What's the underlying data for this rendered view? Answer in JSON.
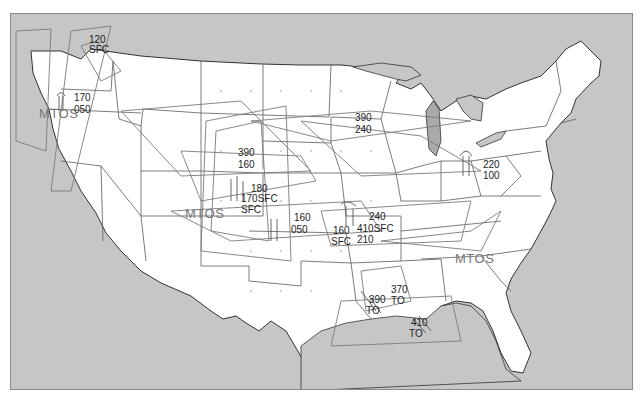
{
  "map": {
    "title": "AIRMET Tango – Turbulence / Strong Surface Winds",
    "colors": {
      "water": "#c6c6c6",
      "land": "#ffffff",
      "state_border": "#5a5a5a",
      "coast": "#333333",
      "airmet_line": "#7a7a7a",
      "label": "#222222",
      "mtos_label": "#7a7a7a",
      "frame": "#8a8a8a"
    },
    "frame": {
      "x": 10,
      "y": 13,
      "width": 623,
      "height": 377
    }
  },
  "labels": {
    "nw_top": "120",
    "nw_bottom": "SFC",
    "nw2_top": "170",
    "nw2_bottom": "050",
    "mtos_west": "MTOS",
    "rockies_top": "390",
    "rockies_bottom": "160",
    "rockies2_top": "180",
    "rockies2_mid": "170SFC",
    "rockies2_bottom": "SFC",
    "mtos_central": "MTOS",
    "plains_top": "160",
    "plains_bottom": "050",
    "kansas_top": "160",
    "kansas_bottom": "SFC",
    "ozark_top": "240",
    "ozark_mid": "410SFC",
    "ozark_bottom": "210",
    "northplains_top": "390",
    "northplains_bottom": "240",
    "ohio_top": "220",
    "ohio_bottom": "100",
    "mtos_east": "MTOS",
    "gulf_top": "370",
    "gulf_mid": "TO",
    "gulf2_top": "390",
    "gulf2_bottom": "TO",
    "gulf3_top": "410",
    "gulf3_bottom": "TO"
  }
}
